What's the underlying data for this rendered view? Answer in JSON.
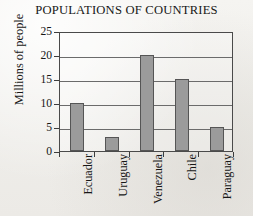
{
  "chart_data": {
    "type": "bar",
    "title": "POPULATIONS OF COUNTRIES",
    "xlabel": "",
    "ylabel": "Millions of people",
    "categories": [
      "Ecuador",
      "Uruguay",
      "Venezuela",
      "Chile",
      "Paraguay"
    ],
    "values": [
      10,
      3,
      20,
      15,
      5
    ],
    "ylim": [
      0,
      25
    ],
    "yticks": [
      0,
      5,
      10,
      15,
      20,
      25
    ],
    "ytick_labels": [
      "0",
      "5",
      "10",
      "15",
      "20",
      "25"
    ],
    "grid": "horizontal",
    "legend": "none",
    "bar_color": "#9b9b9b",
    "bar_edge_color": "#555555",
    "axis_color": "#4a4a4a",
    "background_color": "#f2f1ee",
    "text_color": "#171717"
  }
}
